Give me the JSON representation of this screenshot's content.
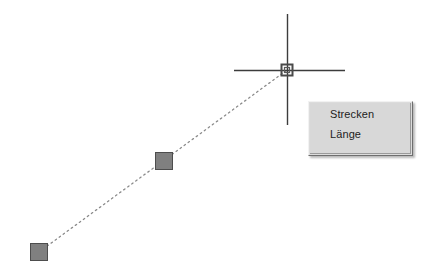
{
  "app": {
    "background_color": "#ffffff",
    "canvas_width": 439,
    "canvas_height": 279
  },
  "drawing": {
    "construction_line": {
      "style": "dotted",
      "color": "#8a8a8a",
      "from": {
        "x": 39,
        "y": 252
      },
      "to": {
        "x": 287,
        "y": 70
      }
    },
    "grips": [
      {
        "name": "grip-endpoint-lower-left",
        "x": 30,
        "y": 243,
        "size": 18,
        "fill": "#808080",
        "stroke": "#4d4d4d"
      },
      {
        "name": "grip-midpoint",
        "x": 155,
        "y": 152,
        "size": 18,
        "fill": "#808080",
        "stroke": "#4d4d4d"
      }
    ]
  },
  "cursor": {
    "name": "crosshair-cursor",
    "center": {
      "x": 287,
      "y": 70
    },
    "color": "#3c3c3c",
    "horizontal": {
      "x1": 234,
      "x2": 345
    },
    "vertical": {
      "y1": 14,
      "y2": 125
    },
    "snap_marker": {
      "name": "osnap-endpoint-square-marker",
      "size": 11,
      "outer_color": "#4a4a4a",
      "inner_color": "#5a5a5a"
    }
  },
  "tooltip": {
    "name": "grip-shortcut-menu",
    "x": 308,
    "y": 101,
    "width": 105,
    "height": 55,
    "background_color": "#d8d8d8",
    "text_color": "#1d1d1d",
    "items": [
      {
        "label": "Strecken"
      },
      {
        "label": "Länge"
      }
    ]
  }
}
